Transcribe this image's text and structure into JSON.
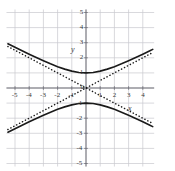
{
  "chart_data": {
    "type": "line",
    "title": "",
    "subtitle": "",
    "xlabel": "x",
    "ylabel": "y",
    "xlim": [
      -5.6,
      4.8
    ],
    "ylim": [
      -5.2,
      5.2
    ],
    "grid": true,
    "grid_step": 1,
    "legend": "none",
    "equation": "y^2/1 - x^2/4 = 1",
    "x_ticks": [
      -5,
      -4,
      -3,
      -2,
      -1,
      1,
      2,
      3,
      4
    ],
    "x_tick_labels": [
      "-5",
      "-4",
      "-3",
      "-2",
      "-1",
      "1",
      "2",
      "3",
      "4"
    ],
    "y_ticks": [
      -5,
      -4,
      -3,
      -2,
      -1,
      1,
      2,
      3,
      4,
      5
    ],
    "y_tick_labels": [
      "-5",
      "-4",
      "-3",
      "-2",
      "-1",
      "1",
      "2",
      "3",
      "4",
      "5"
    ],
    "origin_label": "0",
    "series": [
      {
        "name": "hyperbola-upper-branch",
        "style": "solid",
        "color": "#1a1a1a",
        "x": [
          -5.5,
          -5.0,
          -4.5,
          -4.0,
          -3.5,
          -3.0,
          -2.5,
          -2.0,
          -1.5,
          -1.0,
          -0.5,
          0.0,
          0.5,
          1.0,
          1.5,
          2.0,
          2.5,
          3.0,
          3.5,
          4.0,
          4.5,
          4.7
        ],
        "values": [
          2.926,
          2.693,
          2.462,
          2.236,
          2.015,
          1.803,
          1.601,
          1.414,
          1.25,
          1.118,
          1.031,
          1.0,
          1.031,
          1.118,
          1.25,
          1.414,
          1.601,
          1.803,
          2.015,
          2.236,
          2.462,
          2.556
        ]
      },
      {
        "name": "hyperbola-lower-branch",
        "style": "solid",
        "color": "#1a1a1a",
        "x": [
          -5.5,
          -5.0,
          -4.5,
          -4.0,
          -3.5,
          -3.0,
          -2.5,
          -2.0,
          -1.5,
          -1.0,
          -0.5,
          0.0,
          0.5,
          1.0,
          1.5,
          2.0,
          2.5,
          3.0,
          3.5,
          4.0,
          4.5,
          4.7
        ],
        "values": [
          -2.926,
          -2.693,
          -2.462,
          -2.236,
          -2.015,
          -1.803,
          -1.601,
          -1.414,
          -1.25,
          -1.118,
          -1.031,
          -1.0,
          -1.031,
          -1.118,
          -1.25,
          -1.414,
          -1.601,
          -1.803,
          -2.015,
          -2.236,
          -2.462,
          -2.556
        ]
      },
      {
        "name": "asymptote-positive-slope",
        "style": "dotted",
        "color": "#1a1a1a",
        "equation": "y = x/2",
        "x": [
          -5.5,
          4.7
        ],
        "values": [
          -2.75,
          2.35
        ]
      },
      {
        "name": "asymptote-negative-slope",
        "style": "dotted",
        "color": "#1a1a1a",
        "equation": "y = -x/2",
        "x": [
          -5.5,
          4.7
        ],
        "values": [
          2.75,
          -2.35
        ]
      }
    ],
    "vertices": [
      {
        "x": 0,
        "y": 1
      },
      {
        "x": 0,
        "y": -1
      }
    ],
    "colors": {
      "grid": "#c9c9cf",
      "axis": "#6f6f77",
      "curve": "#1a1a1a",
      "text": "#3a3a3a",
      "background": "#ffffff"
    }
  }
}
